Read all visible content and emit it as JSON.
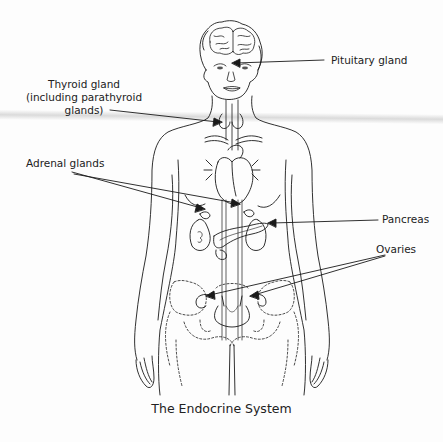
{
  "diagram": {
    "title": "The Endocrine System",
    "labels": {
      "pituitary": "Pituitary gland",
      "thyroid_line1": "Thyroid gland",
      "thyroid_line2": "(including parathyroid",
      "thyroid_line3": "glands)",
      "adrenal": "Adrenal glands",
      "pancreas": "Pancreas",
      "ovaries": "Ovaries"
    },
    "colors": {
      "line": "#1a1a1a",
      "background": "#fdfdfd",
      "band": "#c4c4c4"
    }
  }
}
